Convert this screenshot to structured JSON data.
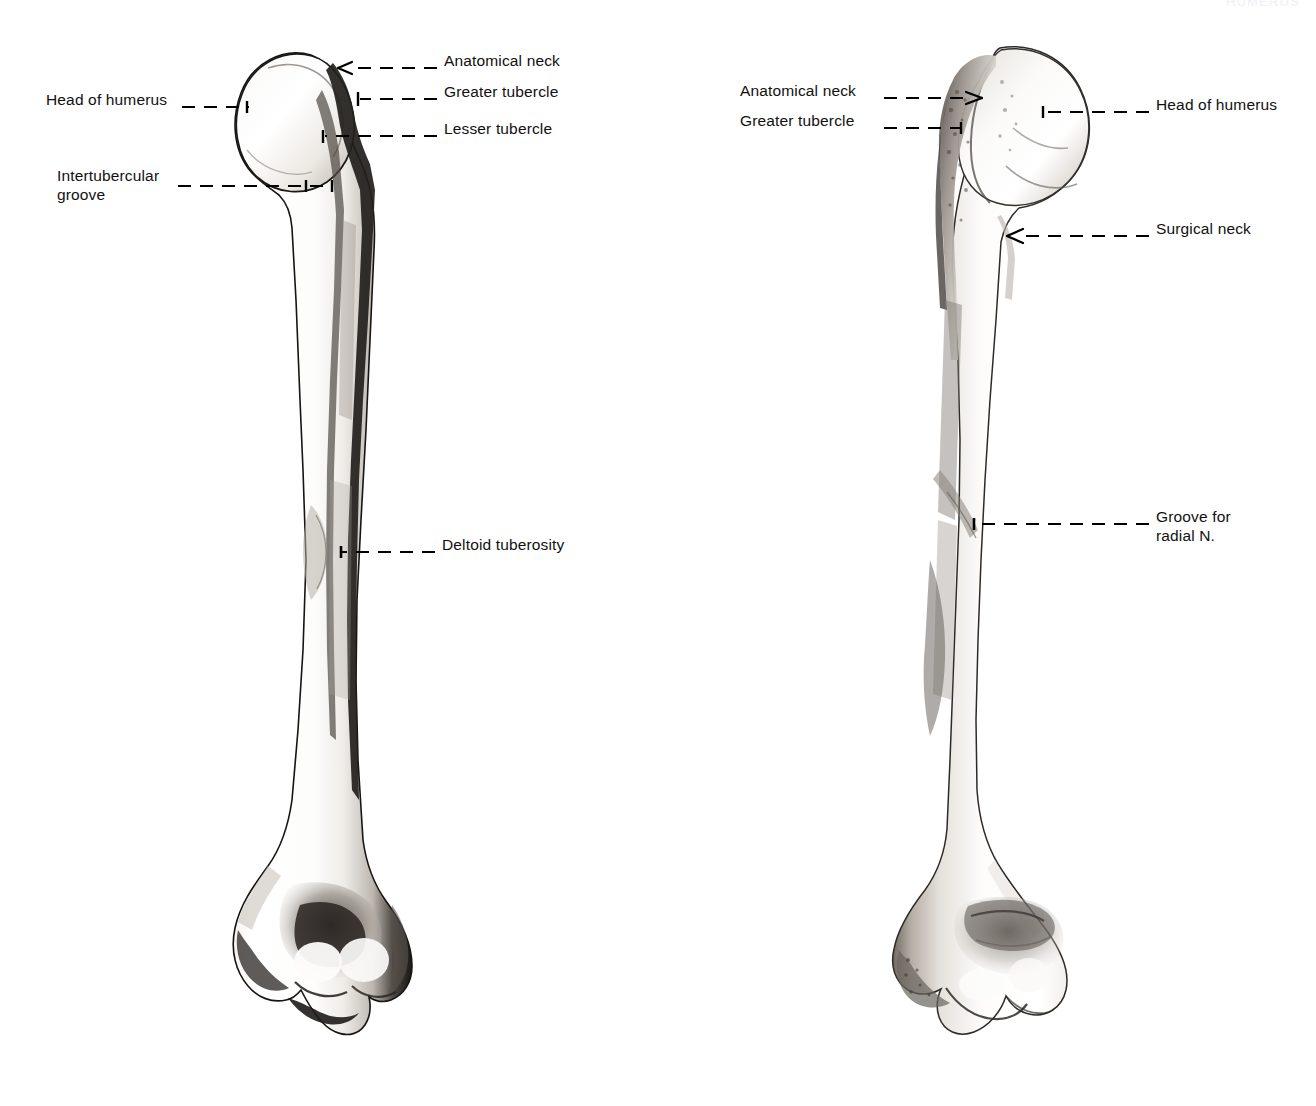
{
  "plate": {
    "width": 1316,
    "height": 1106,
    "background": "#ffffff",
    "ink": "#000000",
    "header_fragment": "HUMERUS"
  },
  "figures": [
    {
      "id": "anterior-humerus",
      "view": "anterior",
      "labels": [
        {
          "id": "anatomical-neck-left",
          "text": "Anatomical neck",
          "text_x": 444,
          "text_y": 59,
          "align": "left",
          "leader": {
            "x1": 437,
            "y1": 68,
            "x2": 345,
            "y2": 68
          },
          "marker": "arrow-left"
        },
        {
          "id": "greater-tubercle-left",
          "text": "Greater tubercle",
          "text_x": 444,
          "text_y": 90,
          "align": "left",
          "leader": {
            "x1": 437,
            "y1": 99,
            "x2": 358,
            "y2": 99
          },
          "marker": "tick-vertical"
        },
        {
          "id": "lesser-tubercle-left",
          "text": "Lesser tubercle",
          "text_x": 444,
          "text_y": 127,
          "align": "left",
          "leader": {
            "x1": 437,
            "y1": 136,
            "x2": 323,
            "y2": 136
          },
          "marker": "tick-vertical"
        },
        {
          "id": "head-of-humerus-left",
          "text": "Head of humerus",
          "text_x": 46,
          "text_y": 98,
          "align": "left",
          "leader": {
            "x1": 182,
            "y1": 107,
            "x2": 249,
            "y2": 107
          },
          "marker": "dot-right"
        },
        {
          "id": "intertubercular-groove-left",
          "text": "Intertubercular\ngroove",
          "text_x": 57,
          "text_y": 174,
          "align": "left",
          "leader": {
            "x1": 178,
            "y1": 186,
            "x2": 330,
            "y2": 186
          },
          "marker": "tick-vertical-right"
        },
        {
          "id": "deltoid-tuberosity-left",
          "text": "Deltoid tuberosity",
          "text_x": 442,
          "text_y": 543,
          "align": "left",
          "leader": {
            "x1": 435,
            "y1": 552,
            "x2": 339,
            "y2": 552
          },
          "marker": "dot-left"
        }
      ]
    },
    {
      "id": "posterior-humerus",
      "view": "posterior",
      "labels": [
        {
          "id": "anatomical-neck-right",
          "text": "Anatomical neck",
          "text_x": 740,
          "text_y": 89,
          "align": "left",
          "leader": {
            "x1": 884,
            "y1": 98,
            "x2": 975,
            "y2": 98
          },
          "marker": "arrow-right"
        },
        {
          "id": "greater-tubercle-right",
          "text": "Greater tubercle",
          "text_x": 740,
          "text_y": 119,
          "align": "left",
          "leader": {
            "x1": 884,
            "y1": 128,
            "x2": 963,
            "y2": 128
          },
          "marker": "dot-right"
        },
        {
          "id": "head-of-humerus-right",
          "text": "Head of humerus",
          "text_x": 1156,
          "text_y": 103,
          "align": "left",
          "leader": {
            "x1": 1149,
            "y1": 112,
            "x2": 1041,
            "y2": 112
          },
          "marker": "dot-left"
        },
        {
          "id": "surgical-neck-right",
          "text": "Surgical neck",
          "text_x": 1156,
          "text_y": 227,
          "align": "left",
          "leader": {
            "x1": 1149,
            "y1": 236,
            "x2": 1013,
            "y2": 236
          },
          "marker": "arrow-left"
        },
        {
          "id": "groove-for-radial-nerve-right",
          "text": "Groove for\nradial N.",
          "text_x": 1156,
          "text_y": 515,
          "align": "left",
          "leader": {
            "x1": 1149,
            "y1": 524,
            "x2": 972,
            "y2": 524
          },
          "marker": "dot-left"
        }
      ]
    }
  ]
}
